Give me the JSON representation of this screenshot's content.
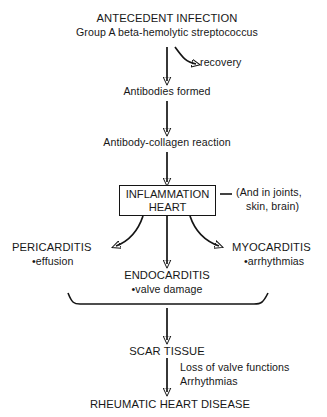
{
  "diagram": {
    "type": "flowchart",
    "colors": {
      "ink": "#141414",
      "background": "#ffffff"
    },
    "nodes": {
      "antecedent_infection": {
        "line1": "ANTECEDENT INFECTION",
        "line2": "Group A beta-hemolytic streptococcus"
      },
      "recovery": "recovery",
      "antibodies_formed": "Antibodies formed",
      "antibody_collagen_reaction": "Antibody-collagen reaction",
      "inflammation_box": {
        "line1": "INFLAMMATION",
        "line2": "HEART"
      },
      "also_in": {
        "dash": "—",
        "line1": "(And in joints,",
        "line2": "skin, brain)"
      },
      "pericarditis": {
        "title": "PERICARDITIS",
        "detail": "•effusion"
      },
      "endocarditis": {
        "title": "ENDOCARDITIS",
        "detail": "•valve damage"
      },
      "myocarditis": {
        "title": "MYOCARDITIS",
        "detail": "•arrhythmias"
      },
      "scar_tissue": "SCAR TISSUE",
      "scar_effects": {
        "line1": "Loss of valve functions",
        "line2": "Arrhythmias"
      },
      "rheumatic_heart_disease": "RHEUMATIC HEART DISEASE"
    },
    "connectors": [
      {
        "name": "infection-to-antibodies",
        "kind": "straight-arrow-down"
      },
      {
        "name": "infection-to-recovery",
        "kind": "curved-arrow-right"
      },
      {
        "name": "antibodies-to-reaction",
        "kind": "straight-arrow-down"
      },
      {
        "name": "reaction-to-inflammation",
        "kind": "straight-arrow-down"
      },
      {
        "name": "inflammation-to-also-in",
        "kind": "dash"
      },
      {
        "name": "inflammation-to-pericarditis",
        "kind": "curved-arrow-left"
      },
      {
        "name": "inflammation-to-endocarditis",
        "kind": "straight-arrow-down"
      },
      {
        "name": "inflammation-to-myocarditis",
        "kind": "curved-arrow-right"
      },
      {
        "name": "carditis-brace",
        "kind": "brace"
      },
      {
        "name": "brace-to-scar-tissue",
        "kind": "straight-arrow-down"
      },
      {
        "name": "scar-to-disease",
        "kind": "straight-arrow-down"
      }
    ]
  }
}
